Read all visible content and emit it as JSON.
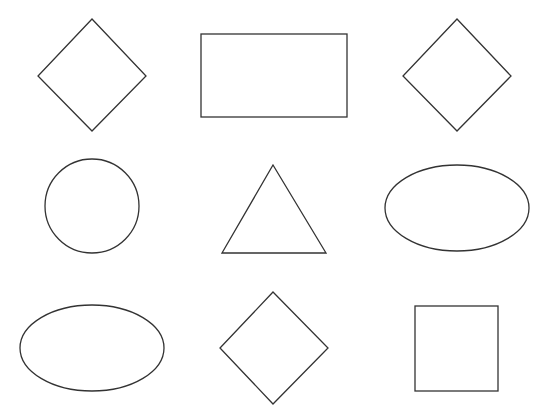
{
  "canvas": {
    "width": 551,
    "height": 417,
    "background": "#ffffff",
    "stroke_color": "#333333",
    "fill_color": "#ffffff"
  },
  "shapes": [
    {
      "id": "r1c1",
      "type": "diamond",
      "row": 1,
      "col": 1,
      "points": "92,19 146,76 92,131 38,76"
    },
    {
      "id": "r1c2",
      "type": "rectangle",
      "row": 1,
      "col": 2,
      "x": 201,
      "y": 34,
      "width": 146,
      "height": 83
    },
    {
      "id": "r1c3",
      "type": "diamond",
      "row": 1,
      "col": 3,
      "points": "457,19 511,76 457,131 403,76"
    },
    {
      "id": "r2c1",
      "type": "circle",
      "row": 2,
      "col": 1,
      "cx": 92,
      "cy": 206,
      "r": 47
    },
    {
      "id": "r2c2",
      "type": "triangle",
      "row": 2,
      "col": 2,
      "points": "273,165 326,253 222,253"
    },
    {
      "id": "r2c3",
      "type": "ellipse",
      "row": 2,
      "col": 3,
      "cx": 457,
      "cy": 208,
      "rx": 72,
      "ry": 43
    },
    {
      "id": "r3c1",
      "type": "ellipse",
      "row": 3,
      "col": 1,
      "cx": 92,
      "cy": 348,
      "rx": 72,
      "ry": 43
    },
    {
      "id": "r3c2",
      "type": "diamond",
      "row": 3,
      "col": 2,
      "points": "273,292 328,348 273,404 220,348"
    },
    {
      "id": "r3c3",
      "type": "square",
      "row": 3,
      "col": 3,
      "x": 415,
      "y": 306,
      "width": 83,
      "height": 85
    }
  ]
}
